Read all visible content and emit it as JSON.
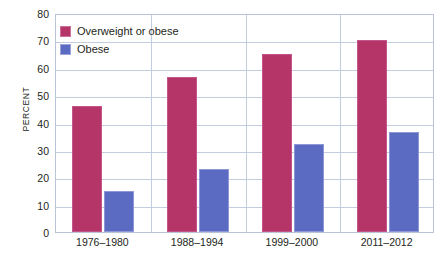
{
  "chart_data": {
    "type": "bar",
    "title": "",
    "subtitle": "",
    "xlabel": "",
    "ylabel": "PERCENT",
    "ylim": [
      0,
      80
    ],
    "y_ticks": [
      0,
      10,
      20,
      30,
      40,
      50,
      60,
      70,
      80
    ],
    "grid": true,
    "legend_position": "top-left",
    "categories": [
      "1976–1980",
      "1988–1994",
      "1999–2000",
      "2011–2012"
    ],
    "series": [
      {
        "name": "Overweight or obese",
        "color": "#b63569",
        "values": [
          46,
          56.5,
          65,
          70
        ]
      },
      {
        "name": "Obese",
        "color": "#5c6bc2",
        "values": [
          15,
          23,
          32,
          36.5
        ]
      }
    ]
  },
  "axis": {
    "y_title": "PERCENT",
    "y_tick_labels": [
      "80",
      "70",
      "60",
      "50",
      "40",
      "30",
      "20",
      "10",
      "0"
    ],
    "x_tick_labels": [
      "1976–1980",
      "1988–1994",
      "1999–2000",
      "2011–2012"
    ]
  },
  "legend": {
    "items": [
      {
        "label": "Overweight or obese",
        "color": "#b63569",
        "swatch": "legend-swatch-overweight"
      },
      {
        "label": "Obese",
        "color": "#5c6bc2",
        "swatch": "legend-swatch-obese"
      }
    ]
  },
  "colors": {
    "overweight": "#b63569",
    "obese": "#5c6bc2",
    "grid": "#c3cddd",
    "frame": "#b9c4d6",
    "text": "#231f20",
    "background": "#ffffff"
  }
}
